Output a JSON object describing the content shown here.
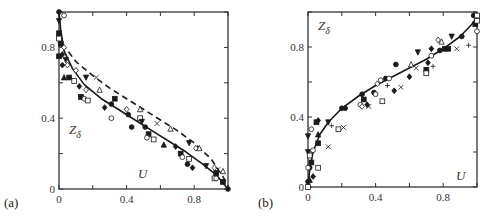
{
  "chart_data": [
    {
      "type": "scatter",
      "panel_label": "(a)",
      "xlabel": "U",
      "ylabel": "Z_δ",
      "ylabel_main": "Z",
      "ylabel_sub": "δ",
      "xlim": [
        0,
        1
      ],
      "ylim": [
        0,
        1
      ],
      "x_ticks": [
        0,
        0.2,
        0.4,
        0.6,
        0.8,
        1.0
      ],
      "x_tick_labels": [
        "0",
        "",
        "0.4",
        "",
        "0.8",
        ""
      ],
      "y_ticks": [
        0,
        0.2,
        0.4,
        0.6,
        0.8,
        1.0
      ],
      "y_tick_labels": [
        "0",
        "",
        "0.4",
        "",
        "0.8",
        ""
      ],
      "grid": false,
      "lines": [
        {
          "name": "solid",
          "style": "solid",
          "x": [
            0,
            0.01,
            0.03,
            0.08,
            0.15,
            0.25,
            0.35,
            0.45,
            0.55,
            0.65,
            0.75,
            0.85,
            0.93,
            1.0
          ],
          "y": [
            1.0,
            0.9,
            0.78,
            0.68,
            0.59,
            0.51,
            0.45,
            0.39,
            0.33,
            0.27,
            0.21,
            0.14,
            0.08,
            0.0
          ]
        },
        {
          "name": "dashed",
          "style": "dashed",
          "x": [
            0.02,
            0.1,
            0.2,
            0.3,
            0.4,
            0.5,
            0.6,
            0.7,
            0.8,
            0.9,
            0.97,
            1.0
          ],
          "y": [
            0.82,
            0.72,
            0.64,
            0.57,
            0.51,
            0.45,
            0.39,
            0.33,
            0.26,
            0.17,
            0.07,
            0.02
          ]
        }
      ],
      "points": [
        {
          "m": "filled-circle",
          "x": 0.0,
          "y": 1.0
        },
        {
          "m": "open-circle",
          "x": 0.03,
          "y": 0.98
        },
        {
          "m": "filled-tri-down",
          "x": 0.0,
          "y": 0.95
        },
        {
          "m": "filled-square",
          "x": 0.0,
          "y": 0.88
        },
        {
          "m": "open-square",
          "x": 0.0,
          "y": 0.85
        },
        {
          "m": "filled-square",
          "x": 0.01,
          "y": 0.82
        },
        {
          "m": "open-diamond",
          "x": 0.03,
          "y": 0.8
        },
        {
          "m": "filled-square",
          "x": 0.0,
          "y": 0.75
        },
        {
          "m": "filled-diamond",
          "x": 0.02,
          "y": 0.76
        },
        {
          "m": "filled-tri-down",
          "x": 0.04,
          "y": 0.73
        },
        {
          "m": "filled-diamond",
          "x": 0.02,
          "y": 0.7
        },
        {
          "m": "open-diamond",
          "x": 0.05,
          "y": 0.7
        },
        {
          "m": "filled-tri-up",
          "x": 0.03,
          "y": 0.63
        },
        {
          "m": "filled-square",
          "x": 0.06,
          "y": 0.63
        },
        {
          "m": "open-square",
          "x": 0.09,
          "y": 0.61
        },
        {
          "m": "open-diamond",
          "x": 0.1,
          "y": 0.67
        },
        {
          "m": "filled-diamond",
          "x": 0.12,
          "y": 0.58
        },
        {
          "m": "open-diamond",
          "x": 0.16,
          "y": 0.56
        },
        {
          "m": "filled-square",
          "x": 0.13,
          "y": 0.52
        },
        {
          "m": "open-circle",
          "x": 0.15,
          "y": 0.51
        },
        {
          "m": "open-square",
          "x": 0.17,
          "y": 0.5
        },
        {
          "m": "filled-tri-down",
          "x": 0.16,
          "y": 0.63
        },
        {
          "m": "cross-x",
          "x": 0.22,
          "y": 0.63
        },
        {
          "m": "open-tri-up",
          "x": 0.24,
          "y": 0.56
        },
        {
          "m": "filled-diamond",
          "x": 0.27,
          "y": 0.46
        },
        {
          "m": "filled-circle",
          "x": 0.31,
          "y": 0.48
        },
        {
          "m": "filled-square",
          "x": 0.33,
          "y": 0.51
        },
        {
          "m": "open-circle",
          "x": 0.31,
          "y": 0.4
        },
        {
          "m": "open-diamond",
          "x": 0.4,
          "y": 0.45
        },
        {
          "m": "filled-circle",
          "x": 0.41,
          "y": 0.42
        },
        {
          "m": "open-tri-up",
          "x": 0.48,
          "y": 0.45
        },
        {
          "m": "open-square",
          "x": 0.48,
          "y": 0.4
        },
        {
          "m": "filled-tri-down",
          "x": 0.49,
          "y": 0.38
        },
        {
          "m": "filled-circle",
          "x": 0.43,
          "y": 0.35
        },
        {
          "m": "filled-circle",
          "x": 0.51,
          "y": 0.35
        },
        {
          "m": "filled-square",
          "x": 0.53,
          "y": 0.31
        },
        {
          "m": "open-circle",
          "x": 0.52,
          "y": 0.29
        },
        {
          "m": "open-square",
          "x": 0.56,
          "y": 0.28
        },
        {
          "m": "cross-x",
          "x": 0.58,
          "y": 0.37
        },
        {
          "m": "open-tri-up",
          "x": 0.66,
          "y": 0.34
        },
        {
          "m": "filled-tri-up",
          "x": 0.62,
          "y": 0.25
        },
        {
          "m": "filled-diamond",
          "x": 0.69,
          "y": 0.24
        },
        {
          "m": "filled-square",
          "x": 0.72,
          "y": 0.2
        },
        {
          "m": "open-circle",
          "x": 0.73,
          "y": 0.18
        },
        {
          "m": "open-square",
          "x": 0.77,
          "y": 0.17
        },
        {
          "m": "filled-circle",
          "x": 0.76,
          "y": 0.14
        },
        {
          "m": "filled-diamond",
          "x": 0.79,
          "y": 0.12
        },
        {
          "m": "filled-tri-down",
          "x": 0.77,
          "y": 0.26
        },
        {
          "m": "open-diamond",
          "x": 0.81,
          "y": 0.23
        },
        {
          "m": "open-tri-up",
          "x": 0.83,
          "y": 0.23
        },
        {
          "m": "filled-tri-down",
          "x": 0.87,
          "y": 0.13
        },
        {
          "m": "open-diamond",
          "x": 0.92,
          "y": 0.12
        },
        {
          "m": "cross-x",
          "x": 0.94,
          "y": 0.11
        },
        {
          "m": "open-tri-up",
          "x": 0.97,
          "y": 0.1
        },
        {
          "m": "filled-square",
          "x": 0.93,
          "y": 0.09
        },
        {
          "m": "open-square",
          "x": 0.92,
          "y": 0.06
        },
        {
          "m": "open-circle",
          "x": 0.93,
          "y": 0.06
        },
        {
          "m": "filled-square",
          "x": 0.97,
          "y": 0.04
        },
        {
          "m": "filled-circle",
          "x": 1.0,
          "y": 0.0
        }
      ]
    },
    {
      "type": "scatter",
      "panel_label": "(b)",
      "xlabel": "U",
      "ylabel": "Z_δ",
      "ylabel_main": "Z",
      "ylabel_sub": "δ",
      "xlim": [
        0,
        1
      ],
      "ylim": [
        0,
        1
      ],
      "x_ticks": [
        0,
        0.2,
        0.4,
        0.6,
        0.8,
        1.0
      ],
      "x_tick_labels": [
        "0",
        "",
        "0.4",
        "",
        "0.8",
        ""
      ],
      "y_ticks": [
        0,
        0.2,
        0.4,
        0.6,
        0.8,
        1.0
      ],
      "y_tick_labels": [
        "0",
        "",
        "0.4",
        "",
        "0.8",
        ""
      ],
      "grid": false,
      "lines": [
        {
          "name": "solid",
          "style": "solid",
          "x": [
            0,
            0.01,
            0.03,
            0.07,
            0.12,
            0.2,
            0.3,
            0.4,
            0.5,
            0.6,
            0.7,
            0.8,
            0.9,
            0.97,
            1.0
          ],
          "y": [
            0.0,
            0.1,
            0.2,
            0.3,
            0.37,
            0.45,
            0.52,
            0.58,
            0.63,
            0.68,
            0.73,
            0.79,
            0.86,
            0.93,
            0.97
          ]
        }
      ],
      "points": [
        {
          "m": "open-square",
          "x": 0.0,
          "y": 0.0
        },
        {
          "m": "filled-tri-up",
          "x": 0.01,
          "y": 0.04
        },
        {
          "m": "filled-circle",
          "x": 0.0,
          "y": 0.03
        },
        {
          "m": "filled-diamond",
          "x": 0.03,
          "y": 0.06
        },
        {
          "m": "filled-circle",
          "x": 0.01,
          "y": 0.11
        },
        {
          "m": "open-circle",
          "x": 0.0,
          "y": 0.11
        },
        {
          "m": "open-square",
          "x": 0.06,
          "y": 0.11
        },
        {
          "m": "filled-square",
          "x": 0.02,
          "y": 0.14
        },
        {
          "m": "filled-tri-down",
          "x": 0.0,
          "y": 0.2
        },
        {
          "m": "open-square",
          "x": 0.01,
          "y": 0.18
        },
        {
          "m": "open-circle",
          "x": 0.03,
          "y": 0.21
        },
        {
          "m": "filled-tri-down",
          "x": 0.0,
          "y": 0.29
        },
        {
          "m": "filled-square",
          "x": 0.06,
          "y": 0.25
        },
        {
          "m": "filled-tri-up",
          "x": 0.06,
          "y": 0.3
        },
        {
          "m": "open-circle",
          "x": 0.02,
          "y": 0.33
        },
        {
          "m": "filled-square",
          "x": 0.05,
          "y": 0.37
        },
        {
          "m": "filled-diamond",
          "x": 0.06,
          "y": 0.38
        },
        {
          "m": "cross-x",
          "x": 0.12,
          "y": 0.23
        },
        {
          "m": "filled-tri-down",
          "x": 0.12,
          "y": 0.37
        },
        {
          "m": "plus",
          "x": 0.14,
          "y": 0.35
        },
        {
          "m": "open-square",
          "x": 0.18,
          "y": 0.33
        },
        {
          "m": "cross-x",
          "x": 0.21,
          "y": 0.34
        },
        {
          "m": "filled-circle",
          "x": 0.2,
          "y": 0.45
        },
        {
          "m": "filled-circle",
          "x": 0.22,
          "y": 0.45
        },
        {
          "m": "filled-circle",
          "x": 0.32,
          "y": 0.53
        },
        {
          "m": "filled-square",
          "x": 0.33,
          "y": 0.5
        },
        {
          "m": "open-circle",
          "x": 0.31,
          "y": 0.47
        },
        {
          "m": "open-diamond",
          "x": 0.32,
          "y": 0.46
        },
        {
          "m": "filled-diamond",
          "x": 0.35,
          "y": 0.47
        },
        {
          "m": "cross-x",
          "x": 0.36,
          "y": 0.46
        },
        {
          "m": "filled-circle",
          "x": 0.39,
          "y": 0.54
        },
        {
          "m": "open-circle",
          "x": 0.4,
          "y": 0.53
        },
        {
          "m": "open-square",
          "x": 0.44,
          "y": 0.49
        },
        {
          "m": "open-diamond",
          "x": 0.41,
          "y": 0.59
        },
        {
          "m": "open-circle",
          "x": 0.43,
          "y": 0.61
        },
        {
          "m": "filled-circle",
          "x": 0.46,
          "y": 0.62
        },
        {
          "m": "open-circle",
          "x": 0.48,
          "y": 0.62
        },
        {
          "m": "plus",
          "x": 0.47,
          "y": 0.58
        },
        {
          "m": "filled-diamond",
          "x": 0.51,
          "y": 0.55
        },
        {
          "m": "cross-x",
          "x": 0.55,
          "y": 0.57
        },
        {
          "m": "filled-circle",
          "x": 0.52,
          "y": 0.7
        },
        {
          "m": "filled-diamond",
          "x": 0.6,
          "y": 0.63
        },
        {
          "m": "open-tri-up",
          "x": 0.61,
          "y": 0.7
        },
        {
          "m": "cross-x",
          "x": 0.64,
          "y": 0.68
        },
        {
          "m": "filled-square",
          "x": 0.7,
          "y": 0.67
        },
        {
          "m": "open-square",
          "x": 0.7,
          "y": 0.65
        },
        {
          "m": "filled-diamond",
          "x": 0.71,
          "y": 0.71
        },
        {
          "m": "plus",
          "x": 0.74,
          "y": 0.69
        },
        {
          "m": "open-circle",
          "x": 0.73,
          "y": 0.75
        },
        {
          "m": "filled-tri-down",
          "x": 0.65,
          "y": 0.77
        },
        {
          "m": "filled-diamond",
          "x": 0.73,
          "y": 0.79
        },
        {
          "m": "open-diamond",
          "x": 0.77,
          "y": 0.84
        },
        {
          "m": "open-tri-up",
          "x": 0.79,
          "y": 0.83
        },
        {
          "m": "filled-circle",
          "x": 0.78,
          "y": 0.78
        },
        {
          "m": "filled-square",
          "x": 0.81,
          "y": 0.79
        },
        {
          "m": "filled-square",
          "x": 0.83,
          "y": 0.79
        },
        {
          "m": "cross-x",
          "x": 0.88,
          "y": 0.79
        },
        {
          "m": "filled-tri-down",
          "x": 0.85,
          "y": 0.86
        },
        {
          "m": "filled-circle",
          "x": 0.91,
          "y": 0.86
        },
        {
          "m": "plus",
          "x": 0.95,
          "y": 0.81
        },
        {
          "m": "filled-circle",
          "x": 0.98,
          "y": 0.98
        },
        {
          "m": "open-square",
          "x": 1.0,
          "y": 0.98
        },
        {
          "m": "filled-square",
          "x": 0.99,
          "y": 0.93
        },
        {
          "m": "open-square",
          "x": 1.0,
          "y": 0.95
        },
        {
          "m": "open-circle",
          "x": 1.0,
          "y": 0.89
        }
      ]
    }
  ],
  "layout": {
    "panels": [
      {
        "x0": 59,
        "x1": 228,
        "y0": 189,
        "y1": 12,
        "label_pos": [
          4,
          207
        ],
        "zlabel_pos": [
          69,
          134
        ],
        "ulabel_pos": [
          138,
          178
        ]
      },
      {
        "x0": 308,
        "x1": 477,
        "y0": 187,
        "y1": 12,
        "label_pos": [
          258,
          207
        ],
        "zlabel_pos": [
          318,
          30
        ],
        "ulabel_pos": [
          456,
          180
        ]
      }
    ]
  },
  "colors": {
    "ink": "#1a1a1a",
    "axis": "#333333",
    "background": "#ffffff"
  }
}
